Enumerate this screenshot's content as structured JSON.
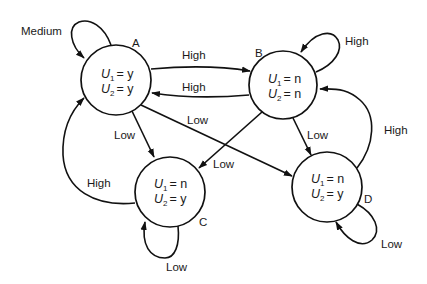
{
  "diagram": {
    "type": "state-transition",
    "states": [
      {
        "id": "A",
        "label": "A",
        "u1_var": "U",
        "u1_sub": "1",
        "u1_val": "= y",
        "u2_var": "U",
        "u2_sub": "2",
        "u2_val": "= y"
      },
      {
        "id": "B",
        "label": "B",
        "u1_var": "U",
        "u1_sub": "1",
        "u1_val": "= n",
        "u2_var": "U",
        "u2_sub": "2",
        "u2_val": "= n"
      },
      {
        "id": "C",
        "label": "C",
        "u1_var": "U",
        "u1_sub": "1",
        "u1_val": "= n",
        "u2_var": "U",
        "u2_sub": "2",
        "u2_val": "= y"
      },
      {
        "id": "D",
        "label": "D",
        "u1_var": "U",
        "u1_sub": "1",
        "u1_val": "= n",
        "u2_var": "U",
        "u2_sub": "2",
        "u2_val": "= y"
      }
    ],
    "transitions": [
      {
        "from": "A",
        "to": "A",
        "label": "Medium"
      },
      {
        "from": "A",
        "to": "B",
        "label": "High"
      },
      {
        "from": "B",
        "to": "A",
        "label": "High"
      },
      {
        "from": "B",
        "to": "B",
        "label": "High"
      },
      {
        "from": "A",
        "to": "C",
        "label": "Low"
      },
      {
        "from": "A",
        "to": "D",
        "label": "Low"
      },
      {
        "from": "B",
        "to": "C",
        "label": "Low"
      },
      {
        "from": "B",
        "to": "D",
        "label": "Low"
      },
      {
        "from": "C",
        "to": "A",
        "label": "High"
      },
      {
        "from": "C",
        "to": "C",
        "label": "Low"
      },
      {
        "from": "D",
        "to": "B",
        "label": "High"
      },
      {
        "from": "D",
        "to": "D",
        "label": "Low"
      }
    ]
  }
}
